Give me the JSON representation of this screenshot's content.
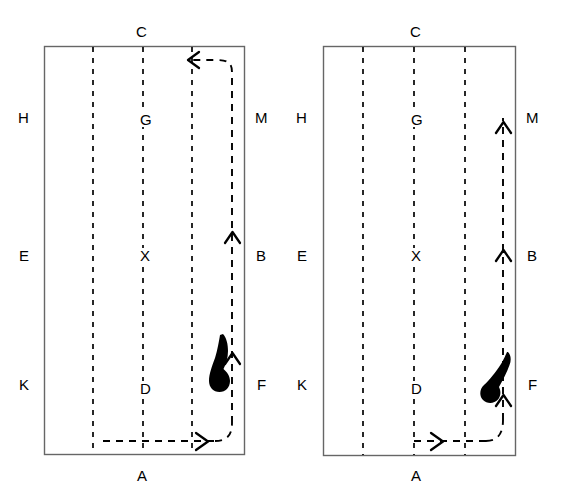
{
  "figure": {
    "type": "diagram",
    "background_color": "#ffffff",
    "line_color": "#000000",
    "border_color": "#555555",
    "blob_color": "#000000"
  },
  "panels": [
    {
      "id": "left",
      "name": "left-panel",
      "rect": {
        "x": 44,
        "y": 46,
        "width": 201,
        "height": 409
      },
      "labels": [
        {
          "key": "C",
          "text": "C",
          "x": 140,
          "y": 31,
          "role": "top-edge"
        },
        {
          "key": "H",
          "text": "H",
          "x": 22,
          "y": 117,
          "role": "left-edge-upper"
        },
        {
          "key": "M",
          "text": "M",
          "x": 259,
          "y": 117,
          "role": "right-edge-upper"
        },
        {
          "key": "E",
          "text": "E",
          "x": 22,
          "y": 256,
          "role": "left-edge-middle"
        },
        {
          "key": "B",
          "text": "B",
          "x": 259,
          "y": 256,
          "role": "right-edge-middle"
        },
        {
          "key": "K",
          "text": "K",
          "x": 22,
          "y": 385,
          "role": "left-edge-lower"
        },
        {
          "key": "F",
          "text": "F",
          "x": 259,
          "y": 385,
          "role": "right-edge-lower"
        },
        {
          "key": "A",
          "text": "A",
          "x": 140,
          "y": 476,
          "role": "bottom-edge"
        },
        {
          "key": "G",
          "text": "G",
          "x": 142,
          "y": 119,
          "role": "interior-upper"
        },
        {
          "key": "X",
          "text": "X",
          "x": 142,
          "y": 255,
          "role": "interior-center"
        },
        {
          "key": "D",
          "text": "D",
          "x": 142,
          "y": 388,
          "role": "interior-lower"
        }
      ],
      "grid_lines_x": [
        93,
        143,
        192,
        232
      ],
      "path_arrowheads": [
        {
          "direction": "right",
          "x": 205,
          "y": 441
        },
        {
          "direction": "up",
          "x": 232,
          "y": 355
        },
        {
          "direction": "up",
          "x": 232,
          "y": 232
        },
        {
          "direction": "left",
          "x": 190,
          "y": 60
        }
      ],
      "blob": {
        "cx": 221,
        "cy": 365,
        "orientation": "vertical-teardrop"
      }
    },
    {
      "id": "right",
      "name": "right-panel",
      "rect": {
        "x": 323,
        "y": 46,
        "width": 193,
        "height": 410
      },
      "labels": [
        {
          "key": "C",
          "text": "C",
          "x": 414,
          "y": 31,
          "role": "top-edge"
        },
        {
          "key": "H",
          "text": "H",
          "x": 300,
          "y": 117,
          "role": "left-edge-upper"
        },
        {
          "key": "M",
          "text": "M",
          "x": 530,
          "y": 117,
          "role": "right-edge-upper"
        },
        {
          "key": "E",
          "text": "E",
          "x": 300,
          "y": 256,
          "role": "left-edge-middle"
        },
        {
          "key": "B",
          "text": "B",
          "x": 530,
          "y": 256,
          "role": "right-edge-middle"
        },
        {
          "key": "K",
          "text": "K",
          "x": 300,
          "y": 385,
          "role": "left-edge-lower"
        },
        {
          "key": "F",
          "text": "F",
          "x": 530,
          "y": 385,
          "role": "right-edge-lower"
        },
        {
          "key": "A",
          "text": "A",
          "x": 414,
          "y": 476,
          "role": "bottom-edge"
        },
        {
          "key": "G",
          "text": "G",
          "x": 414,
          "y": 119,
          "role": "interior-upper"
        },
        {
          "key": "X",
          "text": "X",
          "x": 414,
          "y": 255,
          "role": "interior-center"
        },
        {
          "key": "D",
          "text": "D",
          "x": 414,
          "y": 388,
          "role": "interior-lower"
        }
      ],
      "grid_lines_x": [
        363,
        414,
        465,
        503
      ],
      "path_arrowheads": [
        {
          "direction": "right",
          "x": 440,
          "y": 441
        },
        {
          "direction": "up",
          "x": 503,
          "y": 395
        },
        {
          "direction": "up",
          "x": 503,
          "y": 250
        },
        {
          "direction": "up",
          "x": 503,
          "y": 122
        }
      ],
      "blob": {
        "cx": 493,
        "cy": 380,
        "orientation": "diagonal-teardrop"
      }
    }
  ],
  "legend_keys": [
    "A",
    "B",
    "C",
    "D",
    "E",
    "F",
    "G",
    "H",
    "K",
    "M",
    "X"
  ]
}
